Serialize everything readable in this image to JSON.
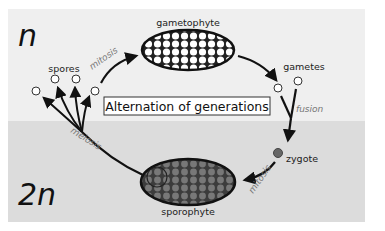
{
  "diagram": {
    "title": "Alternation of generations",
    "regions": {
      "haploid": {
        "label": "n",
        "color": "#efefef"
      },
      "diploid": {
        "label": "2n",
        "color": "#dcdcdc"
      }
    },
    "stages": {
      "gametophyte": "gametophyte",
      "gametes": "gametes",
      "zygote": "zygote",
      "sporophyte": "sporophyte",
      "spores": "spores"
    },
    "processes": {
      "mitosis_top": "mitosis",
      "fusion": "fusion",
      "mitosis_bottom": "mitosis",
      "meiosis": "meiosis"
    },
    "colors": {
      "gametophyte_fill": "#ffffff",
      "sporophyte_fill": "#555555",
      "sporophyte_cells": "#777777",
      "zygote_fill": "#666666",
      "arrow": "#111111",
      "process_text": "#777777"
    }
  }
}
